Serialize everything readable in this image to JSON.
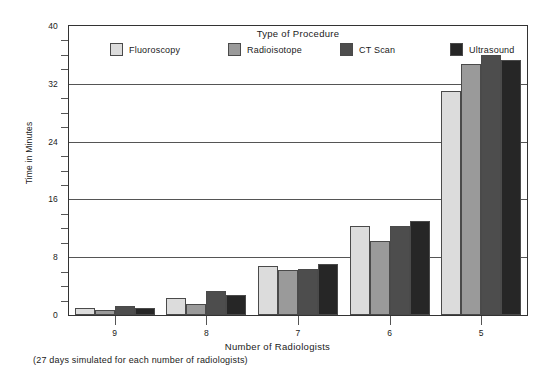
{
  "chart_data": {
    "type": "bar",
    "title": "",
    "legend_title": "Type of Procedure",
    "legend_position": "top-inside",
    "xlabel": "Number of Radiologists",
    "ylabel": "Time in Minutes",
    "footnote": "(27 days simulated for each number of radiologists)",
    "categories": [
      "9",
      "8",
      "7",
      "6",
      "5"
    ],
    "ylim": [
      0,
      40
    ],
    "yticks": [
      0,
      8,
      16,
      24,
      32,
      40
    ],
    "ytick_labels": [
      "0",
      "8",
      "16",
      "24",
      "32",
      "40"
    ],
    "yminor_step": 2,
    "grid": true,
    "series": [
      {
        "name": "Fluoroscopy",
        "color": "#dcdcdc",
        "values": [
          1.0,
          2.3,
          6.8,
          12.3,
          31.0
        ]
      },
      {
        "name": "Radioisotope",
        "color": "#9a9a9a",
        "values": [
          0.7,
          1.5,
          6.2,
          10.2,
          34.7
        ]
      },
      {
        "name": "CT Scan",
        "color": "#4d4d4d",
        "values": [
          1.3,
          3.3,
          6.4,
          12.3,
          36.0
        ]
      },
      {
        "name": "Ultrasound",
        "color": "#262626",
        "values": [
          1.0,
          2.8,
          7.0,
          13.0,
          35.3
        ]
      }
    ]
  },
  "axis": {
    "y_title": "Time in Minutes",
    "x_title": "Number of Radiologists"
  },
  "legend": {
    "title": "Type of Procedure",
    "items": [
      {
        "label": "Fluoroscopy"
      },
      {
        "label": "Radioisotope"
      },
      {
        "label": "CT Scan"
      },
      {
        "label": "Ultrasound"
      }
    ]
  },
  "note": {
    "text": "(27 days simulated for each number of radiologists)"
  }
}
